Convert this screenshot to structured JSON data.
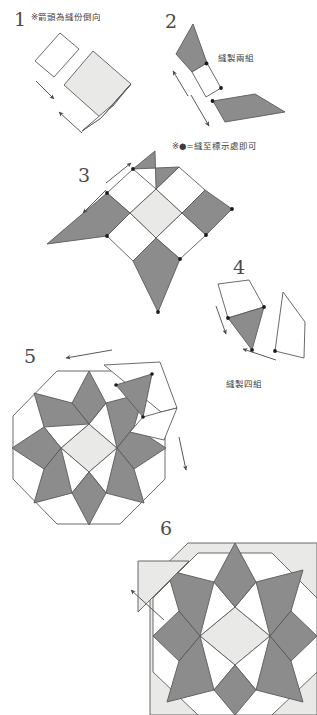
{
  "document": {
    "type": "quilt-piecing-instruction-diagram",
    "language": "zh-Hant",
    "width": 317,
    "height": 715
  },
  "palette": {
    "background": "#ffffff",
    "outline": "#5a5a5a",
    "dark_patch": "#8c8c8c",
    "light_patch": "#e9e9e7",
    "white_patch": "#ffffff",
    "dot": "#1a1a1a",
    "text": "#3d3d3d",
    "numeral": "#4a4a4a"
  },
  "steps": [
    {
      "id": "step-1",
      "number": "1",
      "caption": "※箭頭為縫份倒向"
    },
    {
      "id": "step-2",
      "number": "2",
      "caption": "縫製兩組"
    },
    {
      "id": "step-3",
      "number": "3",
      "caption": ""
    },
    {
      "id": "step-4",
      "number": "4",
      "caption": "縫製四組"
    },
    {
      "id": "step-5",
      "number": "5",
      "caption": ""
    },
    {
      "id": "step-6",
      "number": "6",
      "caption": ""
    }
  ],
  "notes": {
    "seam_direction": "※箭頭為縫份倒向",
    "sew_two_sets": "縫製兩組",
    "dot_marker": "※●=縫至標示處即可",
    "sew_four_sets": "縫製四組"
  },
  "legend": {
    "dot_symbol": "●",
    "arrow_meaning": "seam allowance press direction",
    "dot_meaning": "sew only as far as the marked point"
  }
}
